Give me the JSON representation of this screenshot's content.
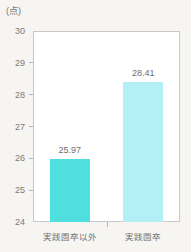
{
  "chart_data": {
    "type": "bar",
    "title": "",
    "subtitle": "",
    "unit_label": "(点)",
    "xlabel": "",
    "ylabel": "",
    "categories": [
      "実践園卒以外",
      "実践園卒"
    ],
    "values": [
      25.97,
      28.41
    ],
    "value_labels": [
      "25.97",
      "28.41"
    ],
    "ylim": [
      24,
      30
    ],
    "yticks": [
      30,
      29,
      28,
      27,
      26,
      25,
      24
    ],
    "ytick_labels": [
      "30",
      "29",
      "28",
      "27",
      "26",
      "25",
      "24"
    ],
    "grid": false,
    "legend": false,
    "legend_position": "none",
    "bar_colors": [
      "#4fdfdf",
      "#b2f0f5"
    ],
    "series": [
      {
        "name": "",
        "values": [
          25.97,
          28.41
        ]
      }
    ]
  },
  "style": {
    "background_color": "#f6f5f1",
    "plot_background_color": "#ffffff",
    "frame_color": "#c9c9c9",
    "text_color": "#6f6f6f",
    "tick_color": "#b5b5b5"
  }
}
